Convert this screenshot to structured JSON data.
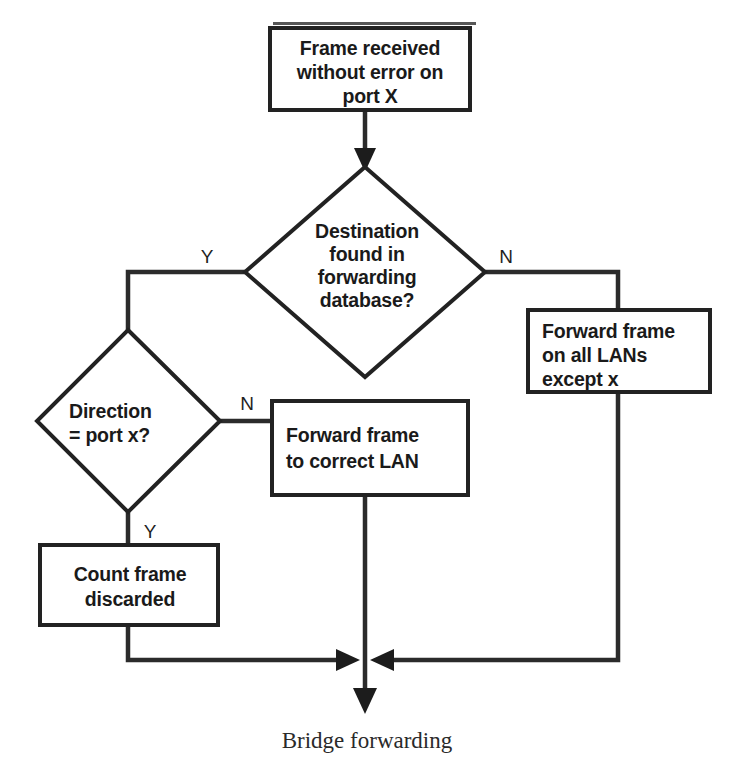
{
  "diagram": {
    "title_caption": "Bridge forwarding",
    "nodes": {
      "start": {
        "kind": "process-box",
        "lines": [
          "Frame received",
          "without error on",
          "port X"
        ],
        "align": "center"
      },
      "decision_lookup": {
        "kind": "decision-diamond",
        "lines": [
          "Destination",
          "found in",
          "forwarding",
          "database?"
        ],
        "align": "center"
      },
      "flood": {
        "kind": "process-box",
        "lines": [
          "Forward frame",
          "on all LANs",
          "except x"
        ],
        "align": "left"
      },
      "decision_direction": {
        "kind": "decision-diamond",
        "lines": [
          "Direction",
          "= port x?"
        ],
        "align": "left"
      },
      "forward_correct": {
        "kind": "process-box",
        "lines": [
          "Forward frame",
          "to correct LAN"
        ],
        "align": "left"
      },
      "discard": {
        "kind": "process-box",
        "lines": [
          "Count frame",
          "discarded"
        ],
        "align": "center"
      }
    },
    "branch_labels": {
      "lookup_yes": "Y",
      "lookup_no": "N",
      "direction_no": "N",
      "direction_yes": "Y"
    },
    "colors": {
      "stroke": "#222222",
      "fill": "#ffffff",
      "text": "#1a1a1a",
      "background": "#ffffff"
    }
  }
}
